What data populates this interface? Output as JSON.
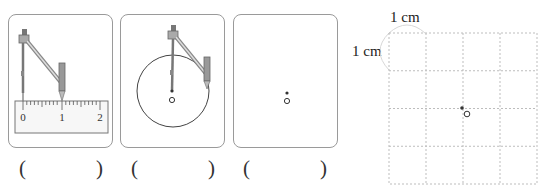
{
  "panels": [
    {
      "id": "step-ruler",
      "description": "compass set on ruler from 0 to 1",
      "ruler": {
        "labels": [
          "0",
          "1",
          "2"
        ]
      },
      "answer": {
        "open": "(",
        "close": ")",
        "value": ""
      }
    },
    {
      "id": "step-draw-circle",
      "description": "compass drawing circle around center O",
      "center_label": "O",
      "answer": {
        "open": "(",
        "close": ")",
        "value": ""
      }
    },
    {
      "id": "step-center-point",
      "description": "center point O only",
      "center_label": "O",
      "answer": {
        "open": "(",
        "close": ")",
        "value": ""
      }
    }
  ],
  "grid": {
    "rows": 4,
    "cols": 4,
    "cell_width_label": "1 cm",
    "cell_height_label": "1 cm",
    "center_label": "O"
  },
  "colors": {
    "panel_border": "#9a9a9a",
    "grid_line": "#bdbdbd",
    "ink": "#333333"
  }
}
